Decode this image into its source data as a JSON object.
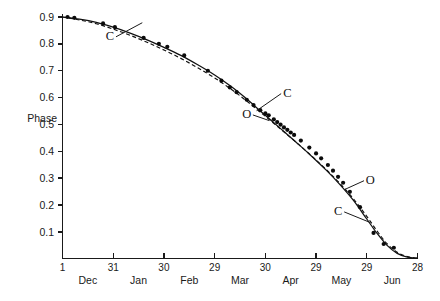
{
  "chart_data": {
    "type": "line",
    "title": "",
    "subtitle": "",
    "xlabel": "",
    "ylabel": "Phase",
    "grid": false,
    "legend_position": "inline-annotations",
    "ylim": [
      0.0,
      0.94
    ],
    "yticks": [
      "0.1",
      "0.2",
      "0.3",
      "0.4",
      "0.5",
      "0.6",
      "0.7",
      "0.8",
      "0.9"
    ],
    "ytick_values": [
      0.1,
      0.2,
      0.3,
      0.4,
      0.5,
      0.6,
      0.7,
      0.8,
      0.9
    ],
    "xtick_numbers": [
      "1",
      "31",
      "30",
      "29",
      "30",
      "29",
      "29",
      "28"
    ],
    "xtick_months": [
      "Dec",
      "Jan",
      "Feb",
      "Mar",
      "Apr",
      "May",
      "Jun"
    ],
    "xlim_days": [
      0,
      210
    ],
    "xtick_days": [
      0,
      30,
      60,
      90,
      120,
      150,
      180,
      210
    ],
    "series": [
      {
        "name": "C",
        "style": "solid",
        "label_text": "C",
        "points_x": [
          0,
          10,
          20,
          30,
          40,
          50,
          60,
          70,
          80,
          90,
          100,
          108,
          116,
          124,
          132,
          140,
          148,
          156,
          164,
          172,
          180,
          186,
          192,
          198,
          204,
          210
        ],
        "points_y": [
          0.9,
          0.892,
          0.88,
          0.862,
          0.84,
          0.815,
          0.787,
          0.757,
          0.722,
          0.684,
          0.64,
          0.6,
          0.556,
          0.512,
          0.468,
          0.424,
          0.378,
          0.33,
          0.277,
          0.218,
          0.148,
          0.095,
          0.05,
          0.02,
          0.006,
          0.002
        ]
      },
      {
        "name": "O",
        "style": "dashed",
        "label_text": "O",
        "points_x": [
          0,
          10,
          20,
          30,
          40,
          50,
          60,
          70,
          80,
          90,
          100,
          108,
          116,
          124,
          132,
          140,
          148,
          156,
          164,
          172,
          180,
          186,
          192,
          198,
          204,
          210
        ],
        "points_y": [
          0.9,
          0.889,
          0.875,
          0.855,
          0.832,
          0.806,
          0.777,
          0.746,
          0.711,
          0.673,
          0.63,
          0.592,
          0.551,
          0.509,
          0.467,
          0.424,
          0.379,
          0.332,
          0.281,
          0.224,
          0.158,
          0.104,
          0.056,
          0.024,
          0.008,
          0.002
        ]
      }
    ],
    "observations": {
      "name": "observed phase measurements",
      "x": [
        3,
        7,
        24,
        31,
        48,
        57,
        62,
        72,
        86,
        94,
        99,
        103,
        109,
        113,
        117,
        120,
        122,
        125,
        127,
        129,
        131,
        133,
        135,
        137,
        141,
        146,
        150,
        153,
        157,
        160,
        163,
        166,
        170,
        176,
        184,
        190,
        196
      ],
      "y": [
        0.9,
        0.897,
        0.876,
        0.862,
        0.822,
        0.8,
        0.789,
        0.757,
        0.7,
        0.663,
        0.638,
        0.62,
        0.592,
        0.572,
        0.553,
        0.541,
        0.534,
        0.519,
        0.509,
        0.499,
        0.489,
        0.48,
        0.47,
        0.461,
        0.44,
        0.414,
        0.392,
        0.374,
        0.349,
        0.328,
        0.305,
        0.283,
        0.249,
        0.192,
        0.096,
        0.055,
        0.041
      ]
    },
    "annotations": [
      {
        "text": "C",
        "label_x": 28,
        "label_y": 0.815,
        "target_x": 47,
        "target_y": 0.878
      },
      {
        "text": "C",
        "label_x": 133,
        "label_y": 0.602,
        "target_x": 115,
        "target_y": 0.552
      },
      {
        "text": "O",
        "label_x": 109,
        "label_y": 0.523,
        "target_x": 122,
        "target_y": 0.515
      },
      {
        "text": "O",
        "label_x": 182,
        "label_y": 0.278,
        "target_x": 167,
        "target_y": 0.258
      },
      {
        "text": "C",
        "label_x": 163,
        "label_y": 0.162,
        "target_x": 182,
        "target_y": 0.135
      }
    ]
  }
}
